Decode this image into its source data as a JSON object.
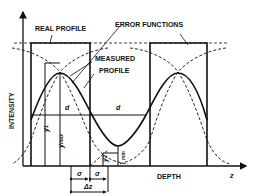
{
  "diagram": {
    "labels": {
      "real_profile": "REAL PROFILE",
      "error_functions": "ERROR FUNCTIONS",
      "measured_line1": "MEASURED",
      "measured_line2": "PROFILE",
      "y_axis": "INTENSITY",
      "x_axis": "DEPTH",
      "x_symbol": "z",
      "d_left": "d",
      "d_right": "d",
      "y1": "y",
      "y1_sub": "1",
      "ymax": "y",
      "ymax_sub": "max",
      "y2": "y",
      "y2_sub": "2",
      "ymin_sub": "min",
      "sigma_left": "σ",
      "sigma_right": "σ",
      "delta_z": "Δz"
    },
    "colors": {
      "ink": "#111111",
      "background": "#ffffff"
    }
  }
}
